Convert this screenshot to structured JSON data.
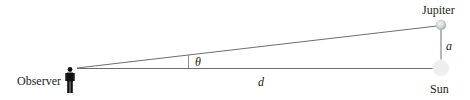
{
  "diagram": {
    "type": "parallax-geometry",
    "labels": {
      "observer": "Observer",
      "jupiter": "Jupiter",
      "sun": "Sun",
      "angle": "θ",
      "distance": "d",
      "separation": "a"
    },
    "colors": {
      "line": "#6d6e71",
      "text": "#231f20",
      "observer_figure": "#111111",
      "jupiter_fill": "#d9dadb",
      "sun_fill": "#eeeeef"
    },
    "nodes": [
      {
        "id": "observer",
        "x": 77,
        "y": 68
      },
      {
        "id": "jupiter",
        "x": 441,
        "y": 25
      },
      {
        "id": "sun",
        "x": 441,
        "y": 68
      }
    ],
    "edges": [
      {
        "from": "observer",
        "to": "jupiter"
      },
      {
        "from": "observer",
        "to": "sun",
        "label": "d"
      },
      {
        "from": "jupiter",
        "to": "sun",
        "label": "a"
      }
    ]
  }
}
